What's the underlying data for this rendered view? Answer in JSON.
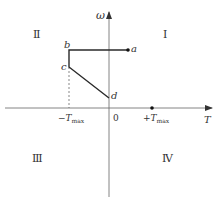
{
  "diagram": {
    "axes": {
      "x_label": "T",
      "y_label": "ω",
      "origin_label": "0"
    },
    "quadrants": {
      "q1": "Ⅰ",
      "q2": "Ⅱ",
      "q3": "Ⅲ",
      "q4": "Ⅳ"
    },
    "points": {
      "a": "a",
      "b": "b",
      "c": "c",
      "d": "d"
    },
    "ticks": {
      "neg_tmax_prefix": "−T",
      "neg_tmax_sub": "max",
      "pos_tmax_prefix": "+T",
      "pos_tmax_sub": "max"
    },
    "colors": {
      "line": "#2a2a2a",
      "axis": "#555555"
    }
  }
}
